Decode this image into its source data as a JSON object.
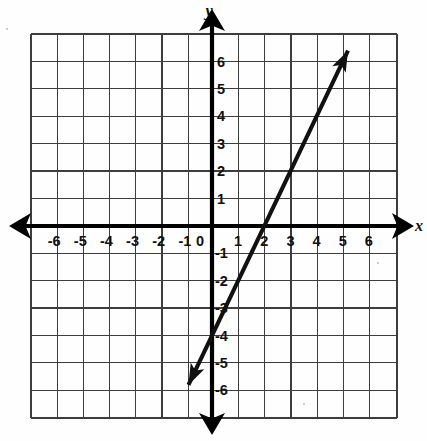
{
  "figure": {
    "kind": "coordinate-plane-graph",
    "background_color": "#ffffff",
    "ink_color": "#111111",
    "grid_line_color": "#3a3a3a",
    "axis_color": "#000000"
  },
  "axes": {
    "x_axis_label": "x",
    "y_axis_label": "y",
    "origin_label": "0",
    "x_ticks": [
      "-6",
      "-5",
      "-4",
      "-3",
      "-2",
      "-1",
      "1",
      "2",
      "3",
      "4",
      "5",
      "6"
    ],
    "y_ticks": [
      "6",
      "5",
      "4",
      "3",
      "2",
      "1",
      "-1",
      "-2",
      "-3",
      "-4",
      "-5",
      "-6"
    ],
    "xlim": [
      -7,
      7
    ],
    "ylim": [
      -7,
      7
    ],
    "grid": true,
    "grid_step": 1,
    "grid_columns": 14,
    "grid_rows": 14,
    "x_arrow_left": true,
    "x_arrow_right": true,
    "y_arrow_up": true,
    "y_arrow_down": true
  },
  "chart_data": {
    "type": "line",
    "title": "",
    "xlabel": "x",
    "ylabel": "y",
    "xlim": [
      -7,
      7
    ],
    "ylim": [
      -7,
      7
    ],
    "grid": true,
    "legend": "none",
    "series": [
      {
        "name": "line",
        "equation": "y = 2x - 4",
        "slope": 2,
        "y_intercept": -4,
        "x_intercept": 2,
        "arrow_both_ends": true,
        "endpoints": [
          {
            "x": -0.9,
            "y": -5.8
          },
          {
            "x": 5.2,
            "y": 6.4
          }
        ],
        "points": [
          {
            "x": 0,
            "y": -4
          },
          {
            "x": 1,
            "y": -2
          },
          {
            "x": 2,
            "y": 0
          },
          {
            "x": 3,
            "y": 2
          },
          {
            "x": 4,
            "y": 4
          },
          {
            "x": 5,
            "y": 6
          }
        ]
      }
    ]
  }
}
